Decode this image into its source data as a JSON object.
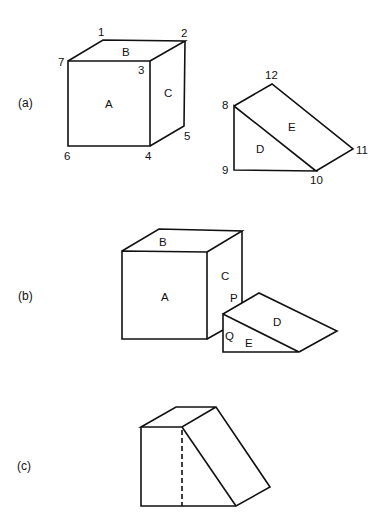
{
  "panels": [
    {
      "id": "a",
      "label": "(a)"
    },
    {
      "id": "b",
      "label": "(b)"
    },
    {
      "id": "c",
      "label": "(c)"
    }
  ],
  "panel_a": {
    "cube": {
      "faces": {
        "front": "A",
        "top": "B",
        "right": "C"
      },
      "vertices": {
        "v1": "1",
        "v2": "2",
        "v3": "3",
        "v4": "4",
        "v5": "5",
        "v6": "6",
        "v7": "7"
      }
    },
    "wedge": {
      "faces": {
        "side": "D",
        "slope": "E"
      },
      "vertices": {
        "v8": "8",
        "v9": "9",
        "v10": "10",
        "v11": "11",
        "v12": "12"
      }
    }
  },
  "panel_b": {
    "cube_faces": {
      "front": "A",
      "top": "B",
      "right": "C"
    },
    "wedge_faces": {
      "slope": "D",
      "side": "E"
    },
    "contact_points": {
      "upper": "P",
      "lower": "Q"
    }
  },
  "panel_c": {}
}
